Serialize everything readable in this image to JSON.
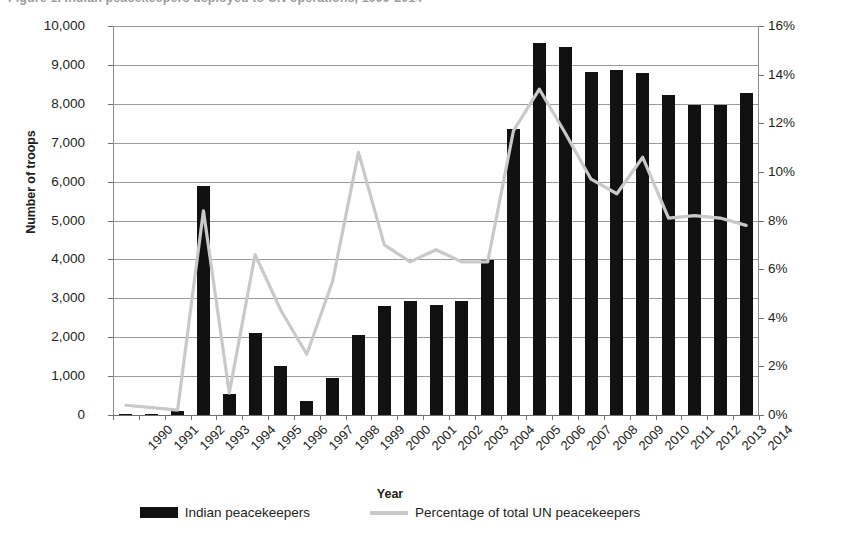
{
  "caption": {
    "text": "Figure 1. Indian peacekeepers deployed to UN operations, 1990-2014"
  },
  "axes": {
    "y_left_title": "Number of troops",
    "x_title": "Year",
    "y_left_ticks": [
      "10,000",
      "9,000",
      "8,000",
      "7,000",
      "6,000",
      "5,000",
      "4,000",
      "3,000",
      "2,000",
      "1,000",
      "0"
    ],
    "y_right_ticks": [
      "16%",
      "14%",
      "12%",
      "10%",
      "8%",
      "6%",
      "4%",
      "2%",
      "0%"
    ]
  },
  "legend": {
    "items": [
      {
        "label": "Indian peacekeepers",
        "marker": "bar-swatch",
        "color": "#111111"
      },
      {
        "label": "Percentage of total UN peacekeepers",
        "marker": "line-swatch",
        "color": "#c9c9c9"
      }
    ]
  },
  "colors": {
    "bar": "#111111",
    "line": "#c9c9c9",
    "grid": "#9a9a9a",
    "text": "#231f20"
  },
  "chart_data": {
    "type": "bar",
    "title": "Indian peacekeepers deployed to UN operations, 1990-2014",
    "xlabel": "Year",
    "ylabel": "Number of troops",
    "y2label": "Percentage of total UN peacekeepers",
    "ylim": [
      0,
      10000
    ],
    "y2lim": [
      0,
      16
    ],
    "ytick_step": 1000,
    "y2tick_step": 2,
    "grid": true,
    "legend_position": "bottom",
    "categories": [
      "1990",
      "1991",
      "1992",
      "1993",
      "1994",
      "1995",
      "1996",
      "1997",
      "1998",
      "1999",
      "2000",
      "2001",
      "2002",
      "2003",
      "2004",
      "2005",
      "2006",
      "2007",
      "2008",
      "2009",
      "2010",
      "2011",
      "2012",
      "2013",
      "2014"
    ],
    "series": [
      {
        "name": "Indian peacekeepers",
        "type": "bar",
        "axis": "left",
        "unit": "troops",
        "color": "#111111",
        "values": [
          30,
          25,
          110,
          5880,
          530,
          2110,
          1250,
          360,
          950,
          2050,
          2800,
          2930,
          2820,
          2930,
          3980,
          7340,
          9570,
          9460,
          8820,
          8860,
          8800,
          8230,
          7980,
          7980,
          8270
        ]
      },
      {
        "name": "Percentage of total UN peacekeepers",
        "type": "line",
        "axis": "right",
        "unit": "percent",
        "color": "#c9c9c9",
        "values": [
          0.4,
          0.3,
          0.2,
          8.4,
          0.9,
          6.6,
          4.3,
          2.5,
          5.5,
          10.8,
          7.0,
          6.3,
          6.8,
          6.3,
          6.3,
          11.7,
          13.4,
          11.6,
          9.7,
          9.1,
          10.6,
          8.1,
          8.2,
          8.1,
          7.8
        ]
      }
    ]
  }
}
